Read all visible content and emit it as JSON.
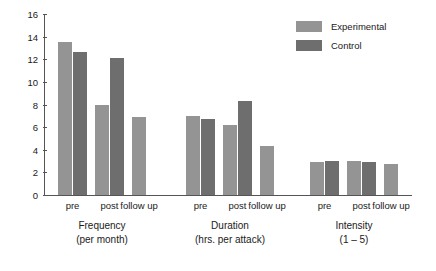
{
  "chart_data": {
    "type": "bar",
    "title": "",
    "xlabel": "",
    "ylabel": "",
    "ylim": [
      0,
      16
    ],
    "yticks": [
      0,
      2,
      4,
      6,
      8,
      10,
      12,
      14,
      16
    ],
    "grid": false,
    "legend_position": "top-right",
    "categories": [
      "pre",
      "post",
      "follow up",
      "pre",
      "post",
      "follow up",
      "pre",
      "post",
      "follow up"
    ],
    "groups": [
      {
        "name": "Frequency",
        "unit": "(per month)",
        "label_line1": "Frequency",
        "label_line2": "(per month)",
        "points": [
          {
            "category": "pre",
            "experimental": 13.5,
            "control": 12.6
          },
          {
            "category": "post",
            "experimental": 8.0,
            "control": 12.1
          },
          {
            "category": "follow up",
            "experimental": 6.9,
            "control": null
          }
        ]
      },
      {
        "name": "Duration",
        "unit": "(hrs. per attack)",
        "label_line1": "Duration",
        "label_line2": "(hrs. per attack)",
        "points": [
          {
            "category": "pre",
            "experimental": 7.0,
            "control": 6.7
          },
          {
            "category": "post",
            "experimental": 6.2,
            "control": 8.3
          },
          {
            "category": "follow up",
            "experimental": 4.3,
            "control": null
          }
        ]
      },
      {
        "name": "Intensity",
        "unit": "(1 – 5)",
        "label_line1": "Intensity",
        "label_line2": "(1 – 5)",
        "points": [
          {
            "category": "pre",
            "experimental": 2.9,
            "control": 3.05
          },
          {
            "category": "post",
            "experimental": 3.0,
            "control": 2.9
          },
          {
            "category": "follow up",
            "experimental": 2.7,
            "control": null
          }
        ]
      }
    ],
    "series": [
      {
        "name": "Experimental",
        "color": "#949494",
        "values": [
          13.5,
          8.0,
          6.9,
          7.0,
          6.2,
          4.3,
          2.9,
          3.0,
          2.7
        ]
      },
      {
        "name": "Control",
        "color": "#6e6e6e",
        "values": [
          12.6,
          12.1,
          null,
          6.7,
          8.3,
          null,
          3.05,
          2.9,
          null
        ]
      }
    ]
  },
  "legend": {
    "items": [
      {
        "label": "Experimental",
        "color": "#949494"
      },
      {
        "label": "Control",
        "color": "#6e6e6e"
      }
    ]
  },
  "colors": {
    "experimental": "#949494",
    "control": "#6e6e6e",
    "axis": "#555555",
    "text": "#1a1a1a",
    "background": "#ffffff"
  }
}
